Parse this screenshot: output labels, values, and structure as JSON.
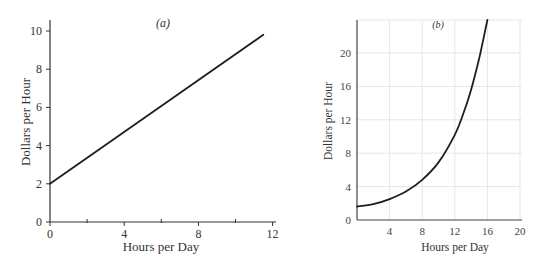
{
  "chart_data": [
    {
      "type": "line",
      "panel_label": "(a)",
      "title": "(a)",
      "xlabel": "Hours per Day",
      "ylabel": "Dollars per Hour",
      "xlim": [
        0,
        12
      ],
      "ylim": [
        0,
        10.5
      ],
      "x_ticks": [
        0,
        4,
        8,
        12
      ],
      "x_tick_labels": [
        "0",
        "4",
        "8",
        "12"
      ],
      "x_minor_ticks": [
        2,
        6,
        10
      ],
      "y_ticks": [
        0,
        2,
        4,
        6,
        8,
        10
      ],
      "y_tick_labels": [
        "0",
        "2",
        "4",
        "6",
        "8",
        "10"
      ],
      "grid": false,
      "series": [
        {
          "name": "wage",
          "x": [
            0,
            11.5
          ],
          "y": [
            2,
            9.8
          ]
        }
      ]
    },
    {
      "type": "line",
      "panel_label": "(b)",
      "title": "(b)",
      "xlabel": "Hours per Day",
      "ylabel": "Dollars per Hour",
      "xlim": [
        0,
        20
      ],
      "ylim": [
        0,
        24
      ],
      "x_ticks": [
        4,
        8,
        12,
        16,
        20
      ],
      "x_tick_labels": [
        "4",
        "8",
        "12",
        "16",
        "20"
      ],
      "y_ticks": [
        0,
        4,
        8,
        12,
        16,
        20
      ],
      "y_tick_labels": [
        "0",
        "4",
        "8",
        "12",
        "16",
        "20"
      ],
      "grid": true,
      "series": [
        {
          "name": "wage",
          "x": [
            0,
            2,
            4,
            6,
            8,
            10,
            12,
            13,
            14,
            15,
            16
          ],
          "y": [
            1.6,
            1.9,
            2.5,
            3.4,
            4.8,
            6.9,
            10.2,
            12.6,
            15.6,
            19.4,
            24.0
          ]
        }
      ]
    }
  ]
}
